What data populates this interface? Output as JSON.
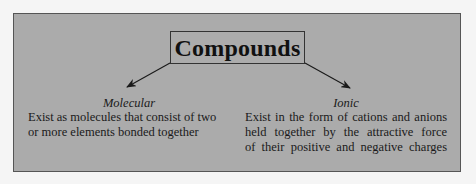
{
  "diagram": {
    "title": "Compounds",
    "branches": [
      {
        "label": "Molecular",
        "description_lines": [
          "Exist as molecules that consist of two",
          "or more elements bonded together"
        ]
      },
      {
        "label": "Ionic",
        "description_lines": [
          "Exist in the form of cations and anions",
          "held together by the attractive force",
          "of their positive and negative charges"
        ]
      }
    ]
  },
  "colors": {
    "page_background": "#f5f5f5",
    "panel_background": "#ababab",
    "border": "#333333",
    "text": "#1a1a1a"
  }
}
